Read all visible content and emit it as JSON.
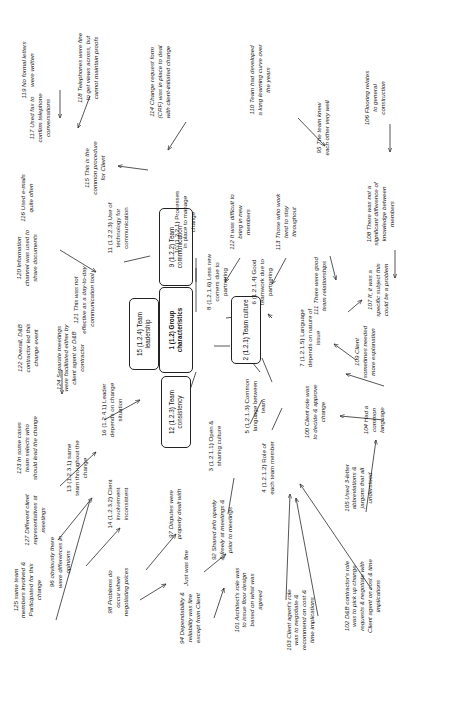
{
  "diagram": {
    "orientation": "rotated-90",
    "accent": "#2b2b2b",
    "nodes": [
      {
        "id": "n1",
        "label": "1 (1.2) Group characteristics",
        "x": 176,
        "y": 330,
        "w": 86,
        "h": 34,
        "bold": true
      },
      {
        "id": "n2",
        "label": "2 (1.2.1) Team culture",
        "x": 246,
        "y": 330,
        "w": 68,
        "h": 30,
        "bold": false
      },
      {
        "id": "n9",
        "label": "9 (1.2.2) Team communication",
        "x": 176,
        "y": 247,
        "w": 78,
        "h": 34,
        "bold": false
      },
      {
        "id": "n15",
        "label": "15 (1.2.4) Team leadership",
        "x": 144,
        "y": 334,
        "w": 72,
        "h": 30,
        "bold": false
      },
      {
        "id": "n12",
        "label": "12 (1.2.3) Team consistency",
        "x": 176,
        "y": 412,
        "w": 72,
        "h": 30,
        "bold": false
      }
    ],
    "labels": [
      {
        "id": "L119",
        "text": "119 No formal letters were written",
        "x": 28,
        "y": 70,
        "w": 66,
        "h": 26,
        "italic": true
      },
      {
        "id": "L116",
        "text": "116 Used e-mails quite often",
        "x": 27,
        "y": 198,
        "w": 58,
        "h": 24,
        "italic": true
      },
      {
        "id": "L118",
        "text": "118 Telephones were fine to get views across, but cannot maintain proofs",
        "x": 88,
        "y": 68,
        "w": 76,
        "h": 42,
        "italic": true
      },
      {
        "id": "L117",
        "text": "117 Used fax to confirm telephone conversations",
        "x": 40,
        "y": 118,
        "w": 60,
        "h": 32,
        "italic": true
      },
      {
        "id": "L115",
        "text": "115 This is the common procedure for Client",
        "x": 95,
        "y": 168,
        "w": 58,
        "h": 30,
        "italic": true
      },
      {
        "id": "L114",
        "text": "114 Change request form (CRF) was in place to deal with client-initiated change",
        "x": 160,
        "y": 82,
        "w": 80,
        "h": 44,
        "italic": true
      },
      {
        "id": "L110",
        "text": "110 Team had developed a long learning curve over the years",
        "x": 260,
        "y": 80,
        "w": 74,
        "h": 38,
        "italic": true
      },
      {
        "id": "L95",
        "text": "95 The team knew each other very well",
        "x": 323,
        "y": 128,
        "w": 62,
        "h": 30,
        "italic": true
      },
      {
        "id": "L106",
        "text": "106 Flooring relates to general construction",
        "x": 375,
        "y": 98,
        "w": 58,
        "h": 30,
        "italic": true
      },
      {
        "id": "L120",
        "text": "120 Information channel was used to share documents",
        "x": 27,
        "y": 258,
        "w": 64,
        "h": 36,
        "italic": true
      },
      {
        "id": "L11",
        "text": "11 (1.2.2.3) Use of technology for communication",
        "x": 118,
        "y": 228,
        "w": 66,
        "h": 34,
        "italic": false
      },
      {
        "id": "L10",
        "text": "10 (1.2.2.1) Processes in place to manage change",
        "x": 185,
        "y": 222,
        "w": 66,
        "h": 34,
        "italic": false
      },
      {
        "id": "L112",
        "text": "112 It was difficult to bring in new members",
        "x": 240,
        "y": 222,
        "w": 58,
        "h": 32,
        "italic": true
      },
      {
        "id": "L113",
        "text": "113 Those who work tend to stay throughout",
        "x": 286,
        "y": 222,
        "w": 58,
        "h": 32,
        "italic": true
      },
      {
        "id": "L108",
        "text": "108 There was not a significant difference of knowledge between members",
        "x": 380,
        "y": 214,
        "w": 70,
        "h": 42,
        "italic": true
      },
      {
        "id": "L121",
        "text": "121 This was not effective as a day-to-day communication tool",
        "x": 84,
        "y": 300,
        "w": 68,
        "h": 38,
        "italic": true
      },
      {
        "id": "L8",
        "text": "8 (1.2.1.6) Less new comers due to partnering",
        "x": 217,
        "y": 282,
        "w": 62,
        "h": 32,
        "italic": false
      },
      {
        "id": "L6",
        "text": "6 (1.2.1.4) Good teamwork due to partnering",
        "x": 262,
        "y": 282,
        "w": 62,
        "h": 32,
        "italic": false
      },
      {
        "id": "L111",
        "text": "111 There were good team relationships",
        "x": 320,
        "y": 286,
        "w": 60,
        "h": 28,
        "italic": true
      },
      {
        "id": "L107",
        "text": "107 If, it was a specific subject this could be a problem",
        "x": 378,
        "y": 290,
        "w": 62,
        "h": 36,
        "italic": true
      },
      {
        "id": "L122",
        "text": "122 Overall, D&B contractor led this change event",
        "x": 28,
        "y": 348,
        "w": 60,
        "h": 30,
        "italic": true
      },
      {
        "id": "L7",
        "text": "7 (1.2.1.5) Language depends on nature of issue",
        "x": 310,
        "y": 338,
        "w": 62,
        "h": 32,
        "italic": false
      },
      {
        "id": "L109",
        "text": "109 Client sometimes needed more explanation",
        "x": 365,
        "y": 352,
        "w": 58,
        "h": 30,
        "italic": true
      },
      {
        "id": "L124",
        "text": "124 Separate meetings were facilitated either by client agent or D&B contractor",
        "x": 70,
        "y": 358,
        "w": 74,
        "h": 44,
        "italic": true
      },
      {
        "id": "L16",
        "text": "16 (1.2.4.1) Leader depends on change situation",
        "x": 112,
        "y": 410,
        "w": 60,
        "h": 32,
        "italic": false
      },
      {
        "id": "L5",
        "text": "5 (1.2.1.3) Common language between team",
        "x": 255,
        "y": 406,
        "w": 62,
        "h": 32,
        "italic": false
      },
      {
        "id": "L100",
        "text": "100 Client role was to decide & approve change",
        "x": 315,
        "y": 412,
        "w": 56,
        "h": 30,
        "italic": true
      },
      {
        "id": "L104",
        "text": "104 Had a common language",
        "x": 374,
        "y": 420,
        "w": 50,
        "h": 22,
        "italic": true
      },
      {
        "id": "L123",
        "text": "123 In some cases team selects who should lead the change",
        "x": 27,
        "y": 448,
        "w": 66,
        "h": 38,
        "italic": true
      },
      {
        "id": "L13",
        "text": "13 (1.2.3.1) same team throughout the change",
        "x": 77,
        "y": 468,
        "w": 60,
        "h": 30,
        "italic": false
      },
      {
        "id": "L127",
        "text": "127 Different clinet representatives at meetings",
        "x": 35,
        "y": 520,
        "w": 56,
        "h": 30,
        "italic": true
      },
      {
        "id": "L14",
        "text": "14 (1.2.3.2) Client involvement inconsistent",
        "x": 118,
        "y": 504,
        "w": 56,
        "h": 30,
        "italic": false
      },
      {
        "id": "L96",
        "text": "96 obviously there were differences in opinions",
        "x": 60,
        "y": 562,
        "w": 58,
        "h": 30,
        "italic": true
      },
      {
        "id": "L97",
        "text": "97 Disputes were properly dealt with",
        "x": 175,
        "y": 514,
        "w": 56,
        "h": 24,
        "italic": true
      },
      {
        "id": "L98",
        "text": "98 Problems do occur when negotiating prices",
        "x": 118,
        "y": 592,
        "w": 56,
        "h": 30,
        "italic": true
      },
      {
        "id": "L3",
        "text": "3 (1.2.1.1) Open & sharing culture",
        "x": 215,
        "y": 446,
        "w": 56,
        "h": 26,
        "italic": false
      },
      {
        "id": "Ljust",
        "text": "Just was fine",
        "x": 186,
        "y": 568,
        "w": 44,
        "h": 14,
        "italic": true
      },
      {
        "id": "L92",
        "text": "92 Shared info openly & freely at meetings & prior to meetings",
        "x": 222,
        "y": 530,
        "w": 62,
        "h": 38,
        "italic": true
      },
      {
        "id": "L94",
        "text": "94 Dependability & reliability was fine except from Client",
        "x": 190,
        "y": 618,
        "w": 62,
        "h": 34,
        "italic": true
      },
      {
        "id": "L4",
        "text": "4 (1.2.1.2) Role of each team member",
        "x": 268,
        "y": 468,
        "w": 56,
        "h": 28,
        "italic": false
      },
      {
        "id": "L101",
        "text": "101 Architect's role was to issue floor design based on what was agreed",
        "x": 248,
        "y": 600,
        "w": 66,
        "h": 40,
        "italic": true
      },
      {
        "id": "L103",
        "text": "103 Client agent's role was to negotiate & recommend on cost & time implications",
        "x": 300,
        "y": 620,
        "w": 70,
        "h": 44,
        "italic": true
      },
      {
        "id": "L102",
        "text": "102 D&B contractor's role was to pick up change requests & negotiate with Client agent on cost & time implications",
        "x": 362,
        "y": 596,
        "w": 78,
        "h": 56,
        "italic": true
      },
      {
        "id": "L105",
        "text": "105 Used 3-letter abbreviations & jargons that all understood",
        "x": 358,
        "y": 488,
        "w": 60,
        "h": 34,
        "italic": true
      },
      {
        "id": "L125",
        "text": "125 same team members involved & Participated for this change",
        "x": 27,
        "y": 590,
        "w": 62,
        "h": 36,
        "italic": true
      }
    ],
    "connectors": [
      {
        "d": "M 60 90 L 60 118",
        "arrow": true
      },
      {
        "d": "M 90 96 L 78 128",
        "arrow": true
      },
      {
        "d": "M 148 170 L 118 166",
        "arrow": true
      },
      {
        "d": "M 186 122 L 168 150",
        "arrow": true
      },
      {
        "d": "M 298 118 L 325 146",
        "arrow": true
      },
      {
        "d": "M 390 124 L 390 152",
        "arrow": true
      },
      {
        "d": "M 60 250 L 96 272",
        "arrow": true
      },
      {
        "d": "M 124 262 L 150 256",
        "arrow": false
      },
      {
        "d": "M 196 258 L 196 282",
        "arrow": false
      },
      {
        "d": "M 240 258 L 225 282",
        "arrow": true
      },
      {
        "d": "M 286 258 L 272 284",
        "arrow": true
      },
      {
        "d": "M 330 256 L 336 280",
        "arrow": true
      },
      {
        "d": "M 395 250 L 395 278",
        "arrow": true
      },
      {
        "d": "M 196 268 L 196 312",
        "arrow": false
      },
      {
        "d": "M 226 318 L 258 314",
        "arrow": true
      },
      {
        "d": "M 272 318 L 268 314",
        "arrow": true
      },
      {
        "d": "M 172 334 L 160 340",
        "arrow": false
      },
      {
        "d": "M 214 346 L 230 346",
        "arrow": false
      },
      {
        "d": "M 348 312 L 362 300",
        "arrow": true
      },
      {
        "d": "M 356 360 L 334 344",
        "arrow": true
      },
      {
        "d": "M 384 386 L 346 374",
        "arrow": true
      },
      {
        "d": "M 384 420 L 340 416",
        "arrow": true
      },
      {
        "d": "M 62 370 L 62 394",
        "arrow": true
      },
      {
        "d": "M 104 420 L 140 400",
        "arrow": true
      },
      {
        "d": "M 196 372 L 188 396",
        "arrow": false
      },
      {
        "d": "M 244 352 L 260 372",
        "arrow": false
      },
      {
        "d": "M 262 358 L 272 382",
        "arrow": false
      },
      {
        "d": "M 250 424 L 262 400",
        "arrow": false
      },
      {
        "d": "M 272 430 L 282 408",
        "arrow": false
      },
      {
        "d": "M 60 486 L 96 452",
        "arrow": true
      },
      {
        "d": "M 58 540 L 92 498",
        "arrow": true
      },
      {
        "d": "M 86 566 L 120 528",
        "arrow": true
      },
      {
        "d": "M 146 570 L 176 534",
        "arrow": true
      },
      {
        "d": "M 140 600 L 166 584",
        "arrow": true
      },
      {
        "d": "M 204 572 L 226 554",
        "arrow": true
      },
      {
        "d": "M 214 618 L 224 588",
        "arrow": true
      },
      {
        "d": "M 228 514 L 234 478",
        "arrow": false
      },
      {
        "d": "M 286 600 L 290 494",
        "arrow": true
      },
      {
        "d": "M 318 616 L 296 498",
        "arrow": true
      },
      {
        "d": "M 372 590 L 300 484",
        "arrow": true
      },
      {
        "d": "M 366 512 L 376 440",
        "arrow": true
      },
      {
        "d": "M 56 620 L 90 500",
        "arrow": false
      }
    ]
  }
}
